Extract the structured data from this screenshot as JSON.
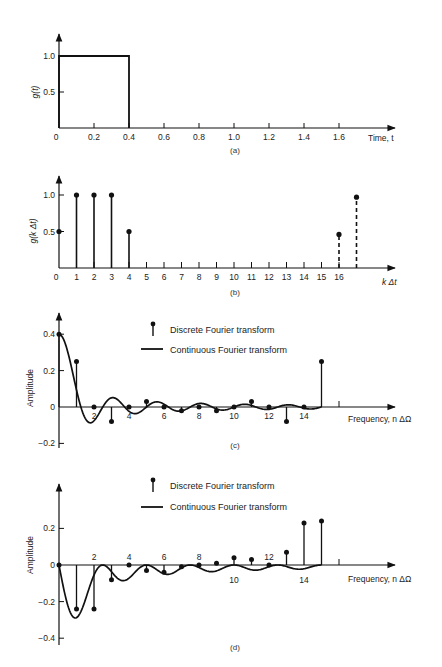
{
  "chart_data": [
    {
      "id": "a",
      "type": "line",
      "caption": "(a)",
      "ylabel": "g(t)",
      "xlabel": "Time, t",
      "xlim": [
        0,
        1.8
      ],
      "ylim": [
        0,
        1.2
      ],
      "xticks": [
        0.2,
        0.4,
        0.6,
        0.8,
        1.0,
        1.2,
        1.4,
        1.6
      ],
      "xtick_labels": [
        "0.2",
        "0.4",
        "0.6",
        "0.8",
        "1.0",
        "1.2",
        "1.4",
        "1.6"
      ],
      "yticks": [
        0.5,
        1.0
      ],
      "ytick_labels": [
        "0.5",
        "1.0"
      ],
      "origin_label": "0",
      "series": [
        {
          "name": "g(t)",
          "x": [
            0,
            0,
            0.4,
            0.4,
            1.8
          ],
          "y": [
            0,
            1.0,
            1.0,
            0,
            0
          ]
        }
      ]
    },
    {
      "id": "b",
      "type": "stem",
      "caption": "(b)",
      "ylabel": "g(k Δt)",
      "xlabel": "k Δt",
      "xlim": [
        0,
        18
      ],
      "ylim": [
        0,
        1.2
      ],
      "xticks": [
        1,
        2,
        3,
        4,
        5,
        6,
        7,
        8,
        9,
        10,
        11,
        12,
        13,
        14,
        15,
        16
      ],
      "xtick_labels": [
        "1",
        "2",
        "3",
        "4",
        "5",
        "6",
        "7",
        "8",
        "9",
        "10",
        "11",
        "12",
        "13",
        "14",
        "15",
        "16"
      ],
      "yticks": [
        0.5,
        1.0
      ],
      "ytick_labels": [
        "0.5",
        "1.0"
      ],
      "origin_label": "0",
      "series": [
        {
          "name": "samples",
          "style": "solid",
          "x": [
            0,
            1,
            2,
            3,
            4
          ],
          "y": [
            0.5,
            1.0,
            1.0,
            1.0,
            0.5
          ]
        },
        {
          "name": "periodic extension",
          "style": "dashed",
          "x": [
            16,
            17
          ],
          "y": [
            0.46,
            0.97
          ]
        }
      ]
    },
    {
      "id": "c",
      "type": "stem+line",
      "caption": "(c)",
      "ylabel": "Amplitude",
      "xlabel": "Frequency, n ΔΩ",
      "xlim": [
        0,
        20
      ],
      "ylim": [
        -0.2,
        0.45
      ],
      "xticks": [
        2,
        4,
        6,
        8,
        10,
        12,
        14
      ],
      "xtick_labels": [
        "2",
        "4",
        "6",
        "8",
        "10",
        "12",
        "14"
      ],
      "extra_tick": 16,
      "yticks": [
        -0.2,
        0,
        0.2,
        0.4
      ],
      "ytick_labels": [
        "−0.2",
        "0",
        "0.2",
        "0.4"
      ],
      "legend": {
        "position": "top-center",
        "entries": [
          "Discrete Fourier transform",
          "Continuous Fourier transform"
        ]
      },
      "discrete": {
        "n": [
          0,
          1,
          2,
          3,
          4,
          5,
          6,
          7,
          8,
          9,
          10,
          11,
          12,
          13,
          14,
          15
        ],
        "values": [
          0.4,
          0.25,
          0,
          -0.08,
          0,
          0.03,
          0,
          -0.02,
          0,
          -0.02,
          0,
          0.03,
          0,
          -0.08,
          0,
          0.25
        ]
      },
      "continuous": {
        "function": "0.4*sinc(0.4*f)",
        "domain": [
          0,
          15.0
        ]
      }
    },
    {
      "id": "d",
      "type": "stem+line",
      "caption": "(d)",
      "ylabel": "Amplitude",
      "xlabel": "Frequency, n ΔΩ",
      "xlim": [
        0,
        20
      ],
      "ylim": [
        -0.4,
        0.35
      ],
      "xticks_above": [
        2,
        4,
        6,
        8,
        12
      ],
      "xtick_labels_above": [
        "2",
        "4",
        "6",
        "8",
        "12"
      ],
      "xticks_below": [
        10,
        14
      ],
      "xtick_labels_below": [
        "10",
        "14"
      ],
      "extra_tick": 16,
      "yticks": [
        -0.4,
        -0.2,
        0,
        0.2
      ],
      "ytick_labels": [
        "−0.4",
        "−0.2",
        "0",
        "0.2"
      ],
      "legend": {
        "position": "top-center",
        "entries": [
          "Discrete Fourier transform",
          "Continuous Fourier transform"
        ]
      },
      "discrete": {
        "n": [
          0,
          1,
          2,
          3,
          4,
          5,
          6,
          7,
          8,
          9,
          10,
          11,
          12,
          13,
          14,
          15
        ],
        "values": [
          0,
          -0.24,
          -0.24,
          -0.08,
          0,
          -0.03,
          -0.04,
          -0.01,
          0,
          0.01,
          0.04,
          0.03,
          0,
          0.07,
          0.23,
          0.24
        ]
      },
      "continuous": {
        "function": "imag part of 0.4*sinc(0.4f)*e^{-j0.4πf}",
        "domain": [
          0,
          15.0
        ]
      }
    }
  ]
}
